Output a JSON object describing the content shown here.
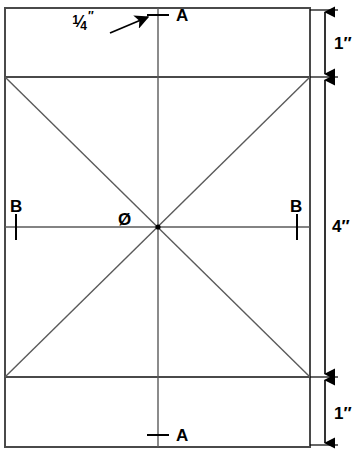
{
  "drawing": {
    "title": "Square layout with diagonals and dimension callouts",
    "background_color": "#ffffff",
    "line_color": "#3a3a3a",
    "text_color": "#000000",
    "geometry": {
      "outer_rect": {
        "x": 5,
        "y": 8,
        "width": 305,
        "height": 439
      },
      "divider_top_y": 77,
      "divider_bottom_y": 377,
      "vertical_centerline_x": 158,
      "horizontal_centerline_y": 227,
      "center_point": {
        "x": 158,
        "y": 227
      },
      "diagonals": "corner-to-corner of the middle panel"
    },
    "dimensions": [
      {
        "name": "top-band-height",
        "value": "1",
        "unit": "″",
        "from_y": 8,
        "to_y": 77,
        "label": "1″"
      },
      {
        "name": "middle-band-height",
        "value": "4",
        "unit": "″",
        "from_y": 77,
        "to_y": 377,
        "label": "4″"
      },
      {
        "name": "bottom-band-height",
        "value": "1",
        "unit": "″",
        "from_y": 377,
        "to_y": 447,
        "label": "1″"
      }
    ],
    "dimension_line_x": 325,
    "labels": {
      "dim_top": "1″",
      "dim_middle": "4″",
      "dim_bottom": "1″",
      "point_a_top": "A",
      "point_a_bottom": "A",
      "point_b_left": "B",
      "point_b_right": "B",
      "center_mark": "Ø",
      "callout_numerator": "1",
      "callout_slash": "⁄",
      "callout_denominator": "4",
      "callout_unit": "″",
      "callout_full": "1/4″"
    },
    "tick_marks": [
      {
        "name": "tick-a-top",
        "orientation": "horizontal",
        "x": 158,
        "y": 15,
        "length": 22
      },
      {
        "name": "tick-a-bottom",
        "orientation": "horizontal",
        "x": 158,
        "y": 435,
        "length": 22
      },
      {
        "name": "tick-b-left",
        "orientation": "vertical",
        "x": 16,
        "y": 227,
        "length": 26
      },
      {
        "name": "tick-b-right",
        "orientation": "vertical",
        "x": 297,
        "y": 227,
        "length": 26
      }
    ],
    "callout_leader": {
      "name": "quarter-inch-leader-arrow",
      "from": {
        "x": 110,
        "y": 33
      },
      "to": {
        "x": 152,
        "y": 16
      },
      "points_to": "tick-a-top"
    }
  }
}
